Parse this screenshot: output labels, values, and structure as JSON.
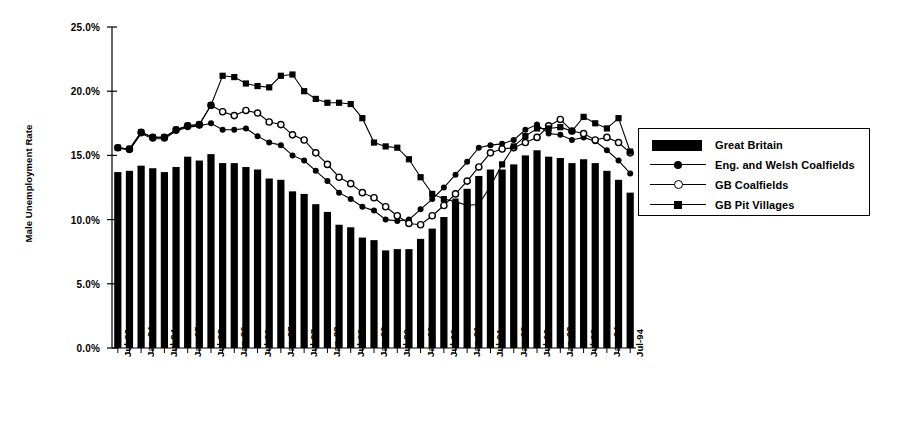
{
  "chart_data": {
    "type": "bar",
    "title": "",
    "xlabel": "",
    "ylabel": "Male Unemployment Rate",
    "ylim": [
      0,
      25
    ],
    "ytick_values": [
      0,
      5,
      10,
      15,
      20,
      25
    ],
    "ytick_labels": [
      "0.0%",
      "5.0%",
      "10.0%",
      "15.0%",
      "20.0%",
      "25.0%"
    ],
    "grid": false,
    "legend_position": "right",
    "x_tick_labels": [
      "Jul-83",
      "Jan-84",
      "Jul-84",
      "Jan-85",
      "Jul-85",
      "Jan-86",
      "Jul-86",
      "Jan-87",
      "Jul-87",
      "Jan-88",
      "Jul-88",
      "Jan-89",
      "Jul-89",
      "Jan-90",
      "Jul-90",
      "Jan-91",
      "Jul-91",
      "Jan-92",
      "Jul-92",
      "Jan-93",
      "Jul-93",
      "Jan-94",
      "Jul-94"
    ],
    "x_period": "quarterly",
    "x_start": "Jul-83",
    "x_end": "Jul-94",
    "series": [
      {
        "name": "Great Britain",
        "style": "bar",
        "marker": "none",
        "values": [
          13.7,
          13.8,
          14.2,
          14.0,
          13.7,
          14.1,
          14.9,
          14.6,
          15.1,
          14.4,
          14.4,
          14.1,
          13.9,
          13.2,
          13.1,
          12.2,
          12.0,
          11.2,
          10.6,
          9.6,
          9.4,
          8.6,
          8.4,
          7.6,
          7.7,
          7.7,
          8.5,
          9.3,
          10.2,
          11.4,
          12.4,
          13.4,
          13.9,
          13.9,
          14.3,
          15.0,
          15.4,
          14.9,
          14.8,
          14.4,
          14.7,
          14.4,
          13.8,
          13.1,
          12.1
        ]
      },
      {
        "name": "Eng. and Welsh Coalfields",
        "style": "line",
        "marker": "filled-circle",
        "values": [
          15.6,
          15.4,
          16.7,
          16.3,
          16.3,
          16.9,
          17.2,
          17.3,
          17.5,
          17.0,
          17.0,
          17.1,
          16.5,
          16.0,
          15.8,
          15.0,
          14.6,
          13.8,
          13.0,
          12.1,
          11.6,
          11.0,
          10.7,
          10.0,
          9.9,
          10.0,
          10.8,
          11.6,
          12.5,
          13.5,
          14.5,
          15.6,
          15.8,
          15.9,
          16.2,
          17.0,
          17.4,
          16.7,
          16.6,
          16.2,
          16.4,
          16.1,
          15.4,
          14.6,
          13.6
        ]
      },
      {
        "name": "GB Coalfields",
        "style": "line",
        "marker": "open-circle",
        "values": [
          15.6,
          15.5,
          16.8,
          16.4,
          16.4,
          17.0,
          17.3,
          17.4,
          18.9,
          18.4,
          18.1,
          18.5,
          18.3,
          17.6,
          17.4,
          16.6,
          16.2,
          15.2,
          14.3,
          13.3,
          12.8,
          12.1,
          11.7,
          11.0,
          10.3,
          9.7,
          9.6,
          10.3,
          11.1,
          12.0,
          13.0,
          14.1,
          15.2,
          15.5,
          15.6,
          16.0,
          16.4,
          17.3,
          17.8,
          16.9,
          16.7,
          16.2,
          16.4,
          16.0,
          15.2
        ]
      },
      {
        "name": "GB Pit Villages",
        "style": "line",
        "marker": "filled-square",
        "values": [
          15.6,
          15.5,
          16.8,
          16.4,
          16.4,
          17.0,
          17.3,
          17.4,
          18.9,
          21.2,
          21.1,
          20.6,
          20.4,
          20.3,
          21.2,
          21.3,
          20.0,
          19.4,
          19.1,
          19.1,
          19.0,
          17.9,
          16.0,
          15.7,
          15.6,
          14.7,
          13.3,
          12.0,
          11.6,
          11.4,
          11.1,
          11.2,
          12.6,
          14.3,
          15.7,
          16.5,
          17.1,
          17.1,
          17.2,
          16.9,
          18.0,
          17.5,
          17.1,
          17.9,
          15.3
        ]
      }
    ]
  },
  "legend": {
    "items": [
      {
        "label": "Great Britain",
        "key": "bar-swatch"
      },
      {
        "label": "Eng. and Welsh Coalfields",
        "key": "line-filled-circle"
      },
      {
        "label": "GB Coalfields",
        "key": "line-open-circle"
      },
      {
        "label": "GB Pit Villages",
        "key": "line-filled-square"
      }
    ]
  },
  "axis": {
    "y_title": "Male Unemployment Rate"
  },
  "colors": {
    "foreground": "#000000",
    "background": "#ffffff",
    "bar_fill": "#000000"
  }
}
